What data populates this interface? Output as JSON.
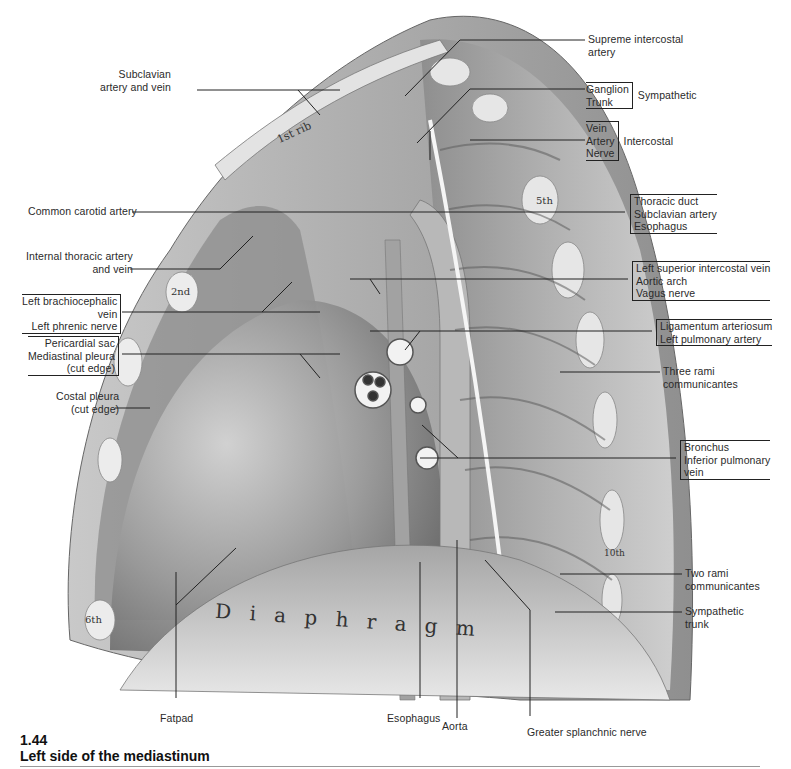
{
  "figure": {
    "number": "1.44",
    "title": "Left side of the mediastinum"
  },
  "labels_left": {
    "subclavian": [
      "Subclavian",
      "artery and vein"
    ],
    "common_carotid": "Common carotid artery",
    "internal_thoracic": [
      "Internal thoracic artery",
      "and vein"
    ],
    "brachiocephalic_group": [
      "Left brachiocephalic",
      "vein",
      "Left phrenic nerve"
    ],
    "pericardial_group": [
      "Pericardial sac",
      "Mediastinal pleura",
      "(cut edge)"
    ],
    "costal_pleura": [
      "Costal pleura",
      "(cut edge)"
    ]
  },
  "labels_right": {
    "supreme_intercostal": [
      "Supreme intercostal",
      "artery"
    ],
    "sympathetic_group": {
      "items": [
        "Ganglion",
        "Trunk"
      ],
      "group": "Sympathetic"
    },
    "intercostal_group": {
      "items": [
        "Vein",
        "Artery",
        "Nerve"
      ],
      "group": "Intercostal"
    },
    "thoracic_group": [
      "Thoracic duct",
      "Subclavian artery",
      "Esophagus"
    ],
    "arch_group": [
      "Left superior intercostal vein",
      "Aortic arch",
      "Vagus nerve"
    ],
    "ligamentum_group": [
      "Ligamentum arteriosum",
      "Left pulmonary artery"
    ],
    "three_rami": [
      "Three rami",
      "communicantes"
    ],
    "bronchus_group": [
      "Bronchus",
      "Inferior pulmonary",
      "vein"
    ],
    "two_rami": [
      "Two rami",
      "communicantes"
    ],
    "sympathetic_trunk": [
      "Sympathetic",
      "trunk"
    ]
  },
  "labels_bottom": {
    "fatpad": "Fatpad",
    "esophagus": "Esophagus",
    "aorta": "Aorta",
    "greater_splanchnic": "Greater splanchnic nerve"
  },
  "in_drawing": {
    "first_rib": "1st rib",
    "rib_2": "2nd",
    "rib_5": "5th",
    "rib_6": "6th",
    "rib_10": "10th",
    "diaphragm": "D i a p h r a g m"
  }
}
